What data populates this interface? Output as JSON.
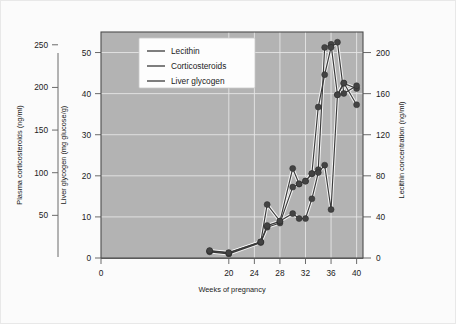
{
  "chart_data": {
    "type": "line",
    "title": "",
    "xlabel": "Weeks of pregnancy",
    "xticks": [
      0,
      20,
      24,
      28,
      32,
      36,
      40
    ],
    "xlim": [
      0,
      41
    ],
    "axes": [
      {
        "id": "left-outer",
        "label": "Plasma corticosteroids (ng/ml)",
        "unit": "ng/ml",
        "ticks": [
          50,
          100,
          150,
          200,
          250
        ],
        "lim": [
          0,
          265
        ]
      },
      {
        "id": "left-inner",
        "label": "Liver glycogen (mg glucose/g)",
        "unit": "mg glucose/g",
        "ticks": [
          0,
          10,
          20,
          30,
          40,
          50
        ],
        "lim": [
          0,
          55
        ]
      },
      {
        "id": "right",
        "label": "Lecithin concentration (ng/ml)",
        "unit": "ng/ml",
        "ticks": [
          0,
          40,
          80,
          120,
          160,
          200
        ],
        "lim": [
          0,
          220
        ]
      }
    ],
    "grid": true,
    "legend_position": "top-left-inside",
    "series": [
      {
        "name": "Lecithin",
        "axis": "right",
        "x": [
          17,
          20,
          25,
          26,
          28,
          30,
          31,
          32,
          33,
          34,
          35,
          36,
          37,
          38,
          40
        ],
        "values": [
          6,
          4,
          15,
          30,
          34,
          69,
          72,
          75,
          82,
          86,
          205,
          208,
          159,
          170,
          165
        ]
      },
      {
        "name": "Corticosteroids",
        "axis": "left-outer",
        "x": [
          17,
          20,
          25,
          26,
          28,
          30,
          31,
          32,
          33,
          34,
          35,
          36,
          37,
          38,
          40
        ],
        "values": [
          8,
          6,
          19,
          38,
          43,
          105,
          87,
          90,
          99,
          177,
          215,
          247,
          253,
          193,
          202
        ]
      },
      {
        "name": "Liver glycogen",
        "axis": "left-inner",
        "x": [
          17,
          20,
          25,
          26,
          28,
          30,
          31,
          32,
          33,
          34,
          35,
          36,
          37,
          38,
          40
        ],
        "values": [
          1.8,
          1.3,
          3.9,
          13.0,
          9.0,
          10.8,
          9.6,
          9.6,
          14.4,
          20.8,
          22.6,
          11.8,
          39.7,
          42.6,
          37.3
        ]
      }
    ],
    "colors": {
      "plot_background": "#b3b3b3",
      "figure_background": "#fbfbfb",
      "line": "#3a3a3a",
      "line_halo": "#f2f2f2",
      "marker": "#434343",
      "grid": "#e9e9e9",
      "axis": "#6b6b6b"
    }
  },
  "legend": {
    "entries": [
      {
        "label": "Lecithin"
      },
      {
        "label": "Corticosteroids"
      },
      {
        "label": "Liver glycogen"
      }
    ]
  },
  "xaxis": {
    "title": "Weeks of pregnancy",
    "ticks": [
      "0",
      "20",
      "24",
      "28",
      "32",
      "36",
      "40"
    ]
  },
  "yaxis_outer": {
    "title": "Plasma corticosteroids (ng/ml)",
    "ticks": [
      "250",
      "200",
      "150",
      "100",
      "50"
    ]
  },
  "yaxis_inner": {
    "title": "Liver glycogen (mg glucose/g)",
    "ticks": [
      "50",
      "40",
      "30",
      "20",
      "10",
      "0"
    ]
  },
  "yaxis_right": {
    "title": "Lecithin concentration (ng/ml)",
    "ticks": [
      "200",
      "160",
      "120",
      "80",
      "40",
      "0"
    ]
  }
}
